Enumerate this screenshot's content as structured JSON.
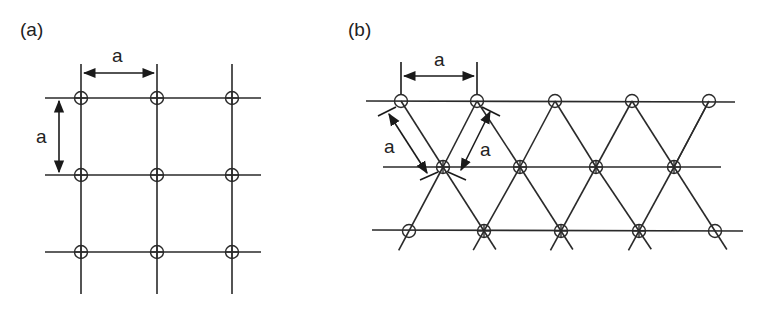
{
  "panels": [
    {
      "id": "a",
      "label": "(a)",
      "lattice": "square",
      "spacing_label": "a",
      "rows_y": [
        98,
        175,
        252
      ],
      "cols_x": [
        81,
        157,
        232
      ],
      "dimension_labels": [
        "a",
        "a"
      ]
    },
    {
      "id": "b",
      "label": "(b)",
      "lattice": "triangular",
      "spacing_label": "a",
      "rows": [
        {
          "y": 101,
          "x": [
            401,
            477,
            555,
            632,
            709
          ]
        },
        {
          "y": 167,
          "x": [
            443,
            520,
            596,
            674
          ]
        },
        {
          "y": 231,
          "x": [
            409,
            484,
            561,
            639,
            715
          ]
        }
      ],
      "dimension_labels": [
        "a",
        "a",
        "a"
      ]
    }
  ],
  "colors": {
    "line": "#2a2a2a",
    "background": "#ffffff"
  }
}
